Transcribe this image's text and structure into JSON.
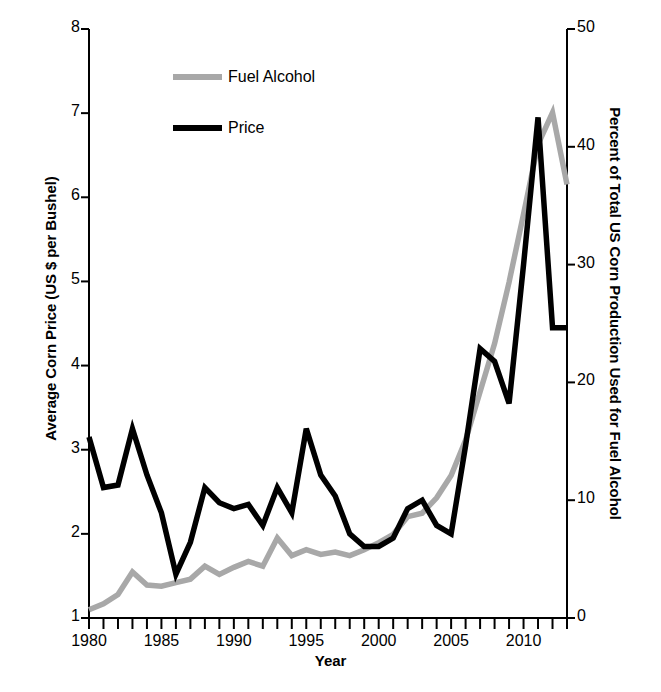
{
  "chart_data": {
    "type": "line",
    "title": "",
    "xlabel": "Year",
    "ylabel": "Average Corn Price (US $ per Bushel)",
    "y2label": "Percent of Total US Corn Production Used for Fuel Alcohol",
    "xlim": [
      1980,
      2013
    ],
    "ylim": [
      1,
      8
    ],
    "y2lim": [
      0,
      50
    ],
    "grid": false,
    "legend_position": "upper-left-inside",
    "x_tick_labels": [
      "1980",
      "1985",
      "1990",
      "1995",
      "2000",
      "2005",
      "2010"
    ],
    "x_tick_values": [
      1980,
      1985,
      1990,
      1995,
      2000,
      2005,
      2010
    ],
    "x_minor_ticks_every": 1,
    "y_tick_labels": [
      "1",
      "2",
      "3",
      "4",
      "5",
      "6",
      "7",
      "8"
    ],
    "y_tick_values": [
      1,
      2,
      3,
      4,
      5,
      6,
      7,
      8
    ],
    "y2_tick_labels": [
      "0",
      "10",
      "20",
      "30",
      "40",
      "50"
    ],
    "y2_tick_values": [
      0,
      10,
      20,
      30,
      40,
      50
    ],
    "x": [
      1980,
      1981,
      1982,
      1983,
      1984,
      1985,
      1986,
      1987,
      1988,
      1989,
      1990,
      1991,
      1992,
      1993,
      1994,
      1995,
      1996,
      1997,
      1998,
      1999,
      2000,
      2001,
      2002,
      2003,
      2004,
      2005,
      2006,
      2007,
      2008,
      2009,
      2010,
      2011,
      2012,
      2013
    ],
    "series": [
      {
        "name": "Fuel Alcohol",
        "color": "#a8a8a8",
        "axis": "right",
        "units": "percent",
        "values": [
          0.7,
          1.2,
          2.0,
          3.9,
          2.8,
          2.7,
          3.0,
          3.3,
          4.4,
          3.7,
          4.3,
          4.8,
          4.4,
          6.8,
          5.3,
          5.8,
          5.4,
          5.6,
          5.3,
          5.8,
          6.4,
          7.1,
          8.6,
          8.9,
          10.2,
          12.1,
          15.1,
          19.2,
          23.3,
          28.5,
          34.3,
          40.2,
          42.9,
          36.8
        ]
      },
      {
        "name": "Price",
        "color": "#000000",
        "axis": "left",
        "units": "usd_per_bushel",
        "values": [
          3.15,
          2.55,
          2.58,
          3.25,
          2.7,
          2.25,
          1.52,
          1.9,
          2.55,
          2.37,
          2.3,
          2.35,
          2.1,
          2.55,
          2.25,
          3.25,
          2.7,
          2.45,
          2.0,
          1.85,
          1.85,
          1.95,
          2.3,
          2.4,
          2.1,
          2.0,
          3.05,
          4.2,
          4.05,
          3.55,
          5.2,
          6.95,
          4.45,
          4.45
        ]
      }
    ]
  },
  "legend": {
    "entries": [
      {
        "label": "Fuel Alcohol",
        "color": "#a8a8a8"
      },
      {
        "label": "Price",
        "color": "#000000"
      }
    ]
  },
  "axes": {
    "left_title": "Average Corn Price (US $ per Bushel)",
    "right_title": "Percent of Total US Corn Production Used for Fuel Alcohol",
    "bottom_title": "Year"
  },
  "colors": {
    "price_line": "#000000",
    "fuel_alcohol_line": "#a8a8a8",
    "axis": "#000000",
    "background": "#ffffff"
  }
}
